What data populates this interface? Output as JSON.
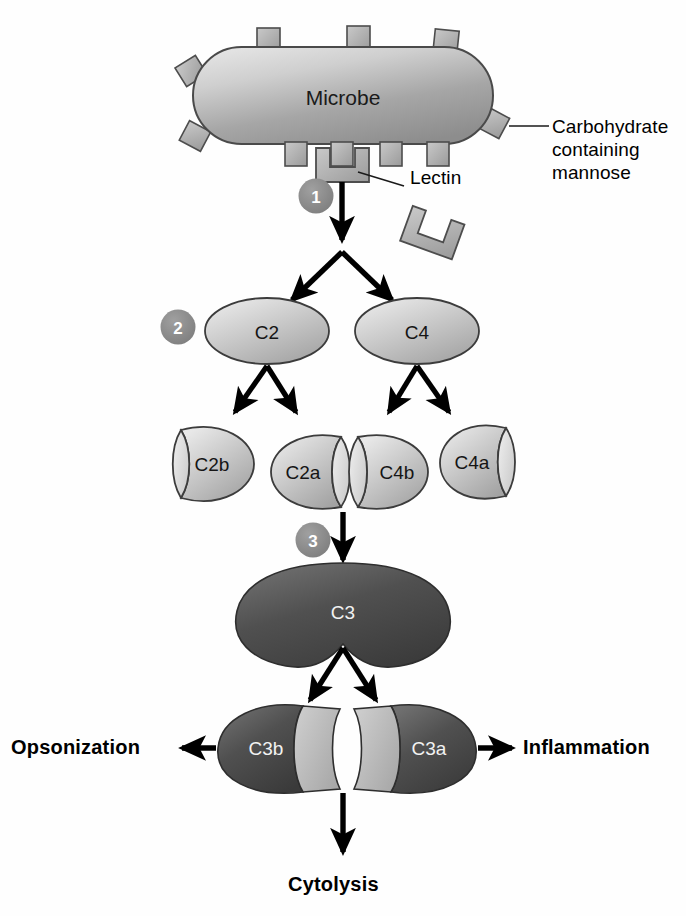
{
  "diagram": {
    "background_color": "#fefefe"
  },
  "microbe": {
    "label": "Microbe",
    "fill_light": "#d8d8d8",
    "fill_dark": "#8f8f8f",
    "stroke": "#4a4a4a"
  },
  "callouts": {
    "lectin": "Lectin",
    "carbohydrate_line1": "Carbohydrate",
    "carbohydrate_line2": "containing",
    "carbohydrate_line3": "mannose"
  },
  "steps": [
    {
      "number": "1"
    },
    {
      "number": "2"
    },
    {
      "number": "3"
    }
  ],
  "step_badge": {
    "fill": "#8a8a8a",
    "text_color": "#ffffff"
  },
  "proteins": {
    "c2": "C2",
    "c4": "C4",
    "c2b": "C2b",
    "c2a": "C2a",
    "c4b": "C4b",
    "c4a": "C4a",
    "c3": "C3",
    "c3b": "C3b",
    "c3a": "C3a"
  },
  "protein_colors": {
    "light_fill": "#c9c9c9",
    "light_fill_hi": "#e6e6e6",
    "dark_fill": "#4a4a4a",
    "dark_fill_hi": "#6d6d6d",
    "cut_face": "#c0c0c0",
    "stroke": "#3c3c3c"
  },
  "outcomes": {
    "opsonization": "Opsonization",
    "inflammation": "Inflammation",
    "cytolysis": "Cytolysis"
  }
}
